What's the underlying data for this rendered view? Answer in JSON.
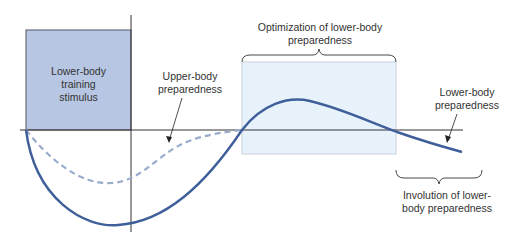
{
  "diagram": {
    "labels": {
      "stimulus": "Lower-body training stimulus",
      "stimulus_lines": [
        "Lower-body",
        "training",
        "stimulus"
      ],
      "upper_body": [
        "Upper-body",
        "preparedness"
      ],
      "optimization": [
        "Optimization of lower-body",
        "preparedness"
      ],
      "lower_body": [
        "Lower-body",
        "preparedness"
      ],
      "involution": [
        "Involution of lower-",
        "body preparedness"
      ]
    },
    "colors": {
      "stimulus_box": "#b7c6e2",
      "optimization_box": "#e8f2fb",
      "solid_curve": "#3f5f9a",
      "dashed_curve": "#9aaccc",
      "axis": "#333333",
      "text": "#333333"
    }
  }
}
